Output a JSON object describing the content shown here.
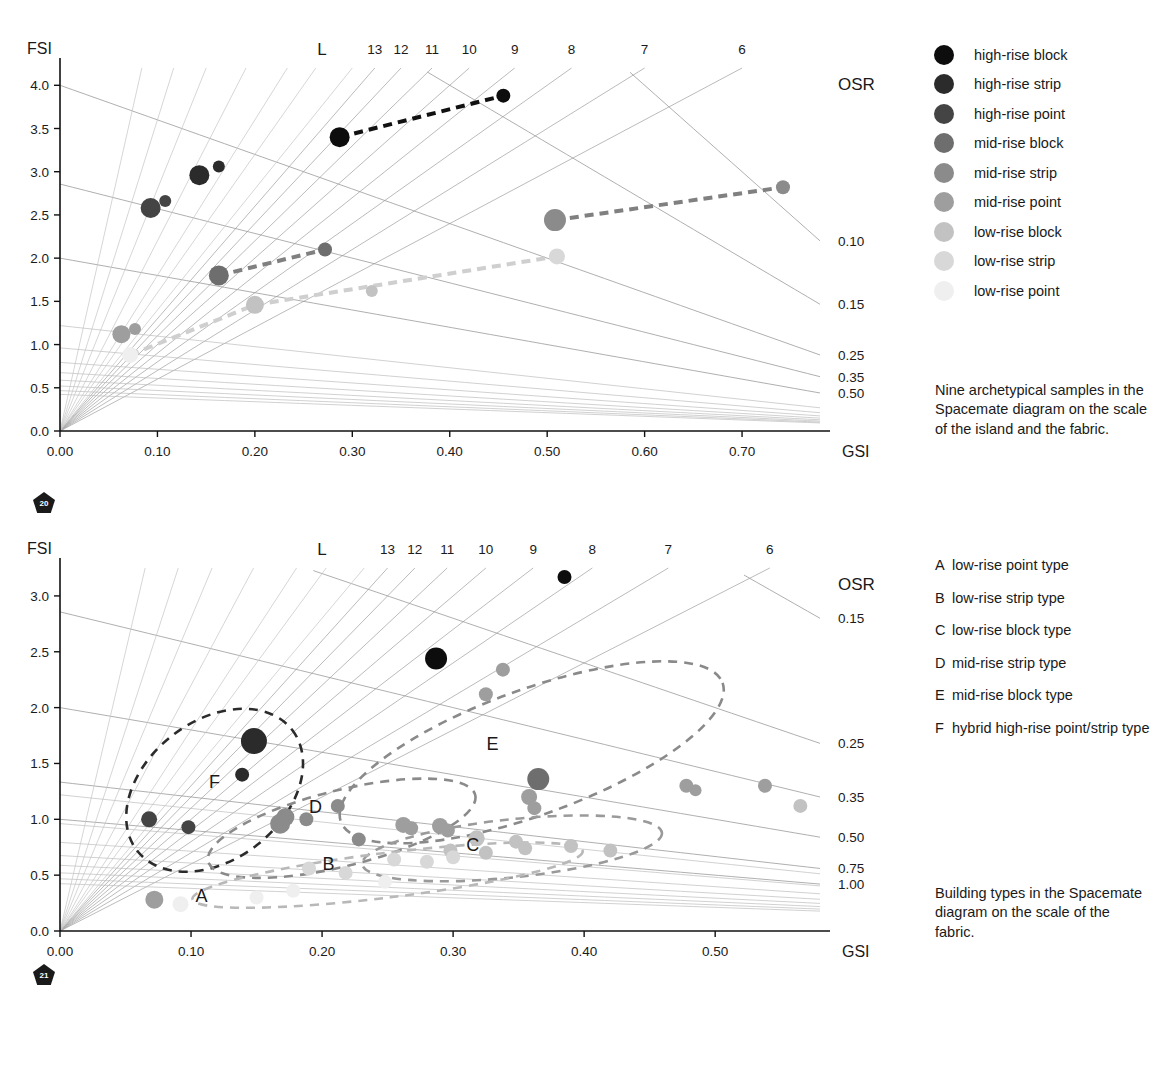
{
  "legend": {
    "items": [
      {
        "label": "high-rise block",
        "color": "#0d0d0d"
      },
      {
        "label": "high-rise strip",
        "color": "#2b2b2b"
      },
      {
        "label": "high-rise point",
        "color": "#444444"
      },
      {
        "label": "mid-rise block",
        "color": "#6e6e6e"
      },
      {
        "label": "mid-rise strip",
        "color": "#8b8b8b"
      },
      {
        "label": "mid-rise point",
        "color": "#9e9e9e"
      },
      {
        "label": "low-rise block",
        "color": "#c2c2c2"
      },
      {
        "label": "low-rise strip",
        "color": "#d8d8d8"
      },
      {
        "label": "low-rise point",
        "color": "#efefef"
      }
    ]
  },
  "captions": {
    "island": "Nine archetypical samples in the Spacemate diagram on the scale of the island and the fabric.",
    "fabric": "Building types in the Spacemate diagram on the scale of the fabric."
  },
  "type_list": [
    {
      "key": "A",
      "text": "low-rise point type"
    },
    {
      "key": "B",
      "text": "low-rise strip type"
    },
    {
      "key": "C",
      "text": "low-rise block type"
    },
    {
      "key": "D",
      "text": "mid-rise strip type"
    },
    {
      "key": "E",
      "text": "mid-rise block type"
    },
    {
      "key": "F",
      "text": "hybrid high-rise point/strip type"
    }
  ],
  "badges": {
    "fig_top": "20",
    "fig_bottom": "21"
  },
  "chart_data": [
    {
      "id": "spacemate-island",
      "type": "scatter",
      "title": "",
      "xlabel": "GSI",
      "ylabel": "FSI",
      "xlim": [
        0.0,
        0.78
      ],
      "ylim": [
        0.0,
        4.2
      ],
      "xticks": [
        "0.00",
        "0.10",
        "0.20",
        "0.30",
        "0.40",
        "0.50",
        "0.60",
        "0.70"
      ],
      "xtick_values": [
        0.0,
        0.1,
        0.2,
        0.3,
        0.4,
        0.5,
        0.6,
        0.7
      ],
      "yticks": [
        "4.0",
        "3.5",
        "3.0",
        "2.5",
        "2.0",
        "1.5",
        "1.0",
        "0.5",
        "0.0"
      ],
      "ytick_values": [
        4.0,
        3.5,
        3.0,
        2.5,
        2.0,
        1.5,
        1.0,
        0.5,
        0.0
      ],
      "grid": true,
      "legend_position": "right-outside",
      "L_label": "L",
      "L_values": [
        13,
        12,
        11,
        10,
        9,
        8,
        7,
        6
      ],
      "OSR_label": "OSR",
      "OSR_values": [
        "0.10",
        "0.15",
        "0.25",
        "0.35",
        "0.50"
      ],
      "OSR_numeric": [
        0.1,
        0.15,
        0.25,
        0.35,
        0.5
      ],
      "points": [
        {
          "gsi": 0.287,
          "fsi": 3.4,
          "cat": "high-rise block",
          "r": 10
        },
        {
          "gsi": 0.455,
          "fsi": 3.88,
          "cat": "high-rise block",
          "r": 7
        },
        {
          "gsi": 0.143,
          "fsi": 2.96,
          "cat": "high-rise strip",
          "r": 10
        },
        {
          "gsi": 0.163,
          "fsi": 3.06,
          "cat": "high-rise strip",
          "r": 6
        },
        {
          "gsi": 0.093,
          "fsi": 2.58,
          "cat": "high-rise point",
          "r": 10
        },
        {
          "gsi": 0.108,
          "fsi": 2.66,
          "cat": "high-rise point",
          "r": 6
        },
        {
          "gsi": 0.163,
          "fsi": 1.8,
          "cat": "mid-rise block",
          "r": 10
        },
        {
          "gsi": 0.272,
          "fsi": 2.1,
          "cat": "mid-rise block",
          "r": 7
        },
        {
          "gsi": 0.508,
          "fsi": 2.44,
          "cat": "mid-rise strip",
          "r": 11
        },
        {
          "gsi": 0.742,
          "fsi": 2.82,
          "cat": "mid-rise strip",
          "r": 7
        },
        {
          "gsi": 0.063,
          "fsi": 1.12,
          "cat": "mid-rise point",
          "r": 9
        },
        {
          "gsi": 0.077,
          "fsi": 1.18,
          "cat": "mid-rise point",
          "r": 6
        },
        {
          "gsi": 0.2,
          "fsi": 1.46,
          "cat": "low-rise block",
          "r": 9
        },
        {
          "gsi": 0.32,
          "fsi": 1.62,
          "cat": "low-rise block",
          "r": 6
        },
        {
          "gsi": 0.51,
          "fsi": 2.02,
          "cat": "low-rise strip",
          "r": 8
        },
        {
          "gsi": 0.072,
          "fsi": 0.88,
          "cat": "low-rise point",
          "r": 8
        }
      ],
      "connectors": [
        {
          "from": [
            0.287,
            3.4
          ],
          "to": [
            0.455,
            3.88
          ],
          "color": "#111111"
        },
        {
          "from": [
            0.163,
            1.8
          ],
          "to": [
            0.272,
            2.1
          ],
          "color": "#808080"
        },
        {
          "from": [
            0.508,
            2.44
          ],
          "to": [
            0.742,
            2.82
          ],
          "color": "#808080"
        },
        {
          "from": [
            0.2,
            1.46
          ],
          "to": [
            0.51,
            2.02
          ],
          "color": "#cfcfcf"
        },
        {
          "from": [
            0.072,
            0.88
          ],
          "to": [
            0.2,
            1.46
          ],
          "color": "#cfcfcf"
        }
      ]
    },
    {
      "id": "spacemate-fabric",
      "type": "scatter",
      "title": "",
      "xlabel": "GSI",
      "ylabel": "FSI",
      "xlim": [
        0.0,
        0.58
      ],
      "ylim": [
        0.0,
        3.25
      ],
      "xticks": [
        "0.00",
        "0.10",
        "0.20",
        "0.30",
        "0.40",
        "0.50"
      ],
      "xtick_values": [
        0.0,
        0.1,
        0.2,
        0.3,
        0.4,
        0.5
      ],
      "yticks": [
        "3.0",
        "2.5",
        "2.0",
        "1.5",
        "1.0",
        "0.5",
        "0.0"
      ],
      "ytick_values": [
        3.0,
        2.5,
        2.0,
        1.5,
        1.0,
        0.5,
        0.0
      ],
      "grid": true,
      "L_label": "L",
      "L_values": [
        13,
        12,
        11,
        10,
        9,
        8,
        7,
        6
      ],
      "OSR_label": "OSR",
      "OSR_values": [
        "0.15",
        "0.25",
        "0.35",
        "0.50",
        "0.75",
        "1.00"
      ],
      "OSR_numeric": [
        0.15,
        0.25,
        0.35,
        0.5,
        0.75,
        1.0
      ],
      "cluster_labels": [
        {
          "key": "A",
          "gsi": 0.108,
          "fsi": 0.26
        },
        {
          "key": "B",
          "gsi": 0.205,
          "fsi": 0.55
        },
        {
          "key": "C",
          "gsi": 0.315,
          "fsi": 0.72
        },
        {
          "key": "D",
          "gsi": 0.195,
          "fsi": 1.06
        },
        {
          "key": "E",
          "gsi": 0.33,
          "fsi": 1.62
        },
        {
          "key": "F",
          "gsi": 0.118,
          "fsi": 1.28
        }
      ],
      "points": [
        {
          "gsi": 0.385,
          "fsi": 3.17,
          "cat": "high-rise block",
          "r": 7
        },
        {
          "gsi": 0.287,
          "fsi": 2.44,
          "cat": "high-rise block",
          "r": 11
        },
        {
          "gsi": 0.148,
          "fsi": 1.7,
          "cat": "high-rise strip",
          "r": 13
        },
        {
          "gsi": 0.139,
          "fsi": 1.4,
          "cat": "high-rise strip",
          "r": 7
        },
        {
          "gsi": 0.068,
          "fsi": 1.0,
          "cat": "high-rise point",
          "r": 8
        },
        {
          "gsi": 0.098,
          "fsi": 0.93,
          "cat": "high-rise point",
          "r": 7
        },
        {
          "gsi": 0.365,
          "fsi": 1.36,
          "cat": "mid-rise block",
          "r": 11
        },
        {
          "gsi": 0.338,
          "fsi": 2.34,
          "cat": "mid-rise point",
          "r": 7
        },
        {
          "gsi": 0.325,
          "fsi": 2.12,
          "cat": "mid-rise point",
          "r": 7
        },
        {
          "gsi": 0.358,
          "fsi": 1.2,
          "cat": "mid-rise point",
          "r": 8
        },
        {
          "gsi": 0.362,
          "fsi": 1.1,
          "cat": "mid-rise point",
          "r": 7
        },
        {
          "gsi": 0.262,
          "fsi": 0.95,
          "cat": "mid-rise point",
          "r": 8
        },
        {
          "gsi": 0.268,
          "fsi": 0.92,
          "cat": "mid-rise point",
          "r": 7
        },
        {
          "gsi": 0.29,
          "fsi": 0.94,
          "cat": "mid-rise point",
          "r": 8
        },
        {
          "gsi": 0.296,
          "fsi": 0.9,
          "cat": "mid-rise point",
          "r": 7
        },
        {
          "gsi": 0.478,
          "fsi": 1.3,
          "cat": "mid-rise point",
          "r": 7
        },
        {
          "gsi": 0.485,
          "fsi": 1.26,
          "cat": "mid-rise point",
          "r": 6
        },
        {
          "gsi": 0.538,
          "fsi": 1.3,
          "cat": "mid-rise point",
          "r": 7
        },
        {
          "gsi": 0.172,
          "fsi": 1.02,
          "cat": "mid-rise strip",
          "r": 9
        },
        {
          "gsi": 0.168,
          "fsi": 0.96,
          "cat": "mid-rise strip",
          "r": 10
        },
        {
          "gsi": 0.188,
          "fsi": 1.0,
          "cat": "mid-rise strip",
          "r": 7
        },
        {
          "gsi": 0.212,
          "fsi": 1.12,
          "cat": "mid-rise strip",
          "r": 7
        },
        {
          "gsi": 0.228,
          "fsi": 0.82,
          "cat": "mid-rise strip",
          "r": 7
        },
        {
          "gsi": 0.565,
          "fsi": 1.12,
          "cat": "low-rise block",
          "r": 7
        },
        {
          "gsi": 0.318,
          "fsi": 0.83,
          "cat": "low-rise block",
          "r": 8
        },
        {
          "gsi": 0.348,
          "fsi": 0.8,
          "cat": "low-rise block",
          "r": 7
        },
        {
          "gsi": 0.298,
          "fsi": 0.72,
          "cat": "low-rise block",
          "r": 7
        },
        {
          "gsi": 0.325,
          "fsi": 0.7,
          "cat": "low-rise block",
          "r": 7
        },
        {
          "gsi": 0.355,
          "fsi": 0.74,
          "cat": "low-rise block",
          "r": 7
        },
        {
          "gsi": 0.39,
          "fsi": 0.76,
          "cat": "low-rise block",
          "r": 7
        },
        {
          "gsi": 0.42,
          "fsi": 0.72,
          "cat": "low-rise block",
          "r": 7
        },
        {
          "gsi": 0.255,
          "fsi": 0.64,
          "cat": "low-rise strip",
          "r": 7
        },
        {
          "gsi": 0.28,
          "fsi": 0.62,
          "cat": "low-rise strip",
          "r": 7
        },
        {
          "gsi": 0.3,
          "fsi": 0.66,
          "cat": "low-rise strip",
          "r": 7
        },
        {
          "gsi": 0.19,
          "fsi": 0.56,
          "cat": "low-rise strip",
          "r": 7
        },
        {
          "gsi": 0.218,
          "fsi": 0.52,
          "cat": "low-rise strip",
          "r": 7
        },
        {
          "gsi": 0.072,
          "fsi": 0.28,
          "cat": "mid-rise point",
          "r": 9
        },
        {
          "gsi": 0.092,
          "fsi": 0.24,
          "cat": "low-rise point",
          "r": 8
        },
        {
          "gsi": 0.15,
          "fsi": 0.3,
          "cat": "low-rise point",
          "r": 7
        },
        {
          "gsi": 0.178,
          "fsi": 0.36,
          "cat": "low-rise point",
          "r": 7
        },
        {
          "gsi": 0.248,
          "fsi": 0.44,
          "cat": "low-rise point",
          "r": 7
        }
      ],
      "ellipses": [
        {
          "key": "F",
          "cx": 0.118,
          "cy": 1.26,
          "rx": 0.075,
          "ry": 0.62,
          "rot": -38,
          "color": "#2b2b2b"
        },
        {
          "key": "D",
          "cx": 0.215,
          "cy": 0.92,
          "rx": 0.105,
          "ry": 0.34,
          "rot": -14,
          "color": "#8a8a8a"
        },
        {
          "key": "E",
          "cx": 0.36,
          "cy": 1.6,
          "rx": 0.155,
          "ry": 0.56,
          "rot": -20,
          "color": "#8a8a8a"
        },
        {
          "key": "C",
          "cx": 0.345,
          "cy": 0.74,
          "rx": 0.115,
          "ry": 0.26,
          "rot": -6,
          "color": "#9a9a9a"
        },
        {
          "key": "B",
          "cx": 0.25,
          "cy": 0.5,
          "rx": 0.15,
          "ry": 0.2,
          "rot": -7,
          "color": "#b8b8b8"
        }
      ]
    }
  ]
}
